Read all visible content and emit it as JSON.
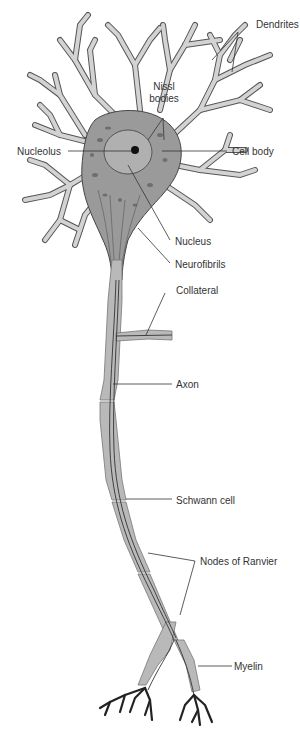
{
  "figure": {
    "labels": {
      "dendrites": "Dendrites",
      "nissl_line1": "Nissl",
      "nissl_line2": "bodies",
      "nucleolus": "Nucleolus",
      "cell_body": "Cell body",
      "nucleus": "Nucleus",
      "neurofibrils": "Neurofibrils",
      "collateral": "Collateral",
      "axon": "Axon",
      "schwann_cell": "Schwann cell",
      "nodes_of_ranvier": "Nodes of Ranvier",
      "myelin": "Myelin"
    },
    "colors": {
      "background": "#ffffff",
      "ink": "#333333",
      "cytoplasm": "#9a9a9a",
      "myelin_sheath": "#b9b9b9"
    }
  }
}
